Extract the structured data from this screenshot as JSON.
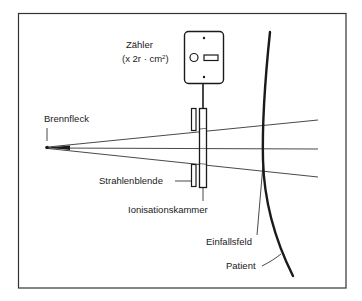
{
  "diagram": {
    "type": "dose-area-product measurement schematic",
    "labels": {
      "counter_title": "Zähler",
      "counter_unit_prefix": "(x 2r · cm",
      "counter_unit_exp": "2",
      "counter_unit_suffix": ")",
      "focal_spot": "Brennfleck",
      "collimator": "Strahlenblende",
      "ionization_chamber": "Ionisationskammer",
      "entrance_field": "Einfallsfeld",
      "patient": "Patient"
    },
    "colors": {
      "ink": "#1a1a1a",
      "background": "#ffffff",
      "frame": "#333333"
    }
  }
}
